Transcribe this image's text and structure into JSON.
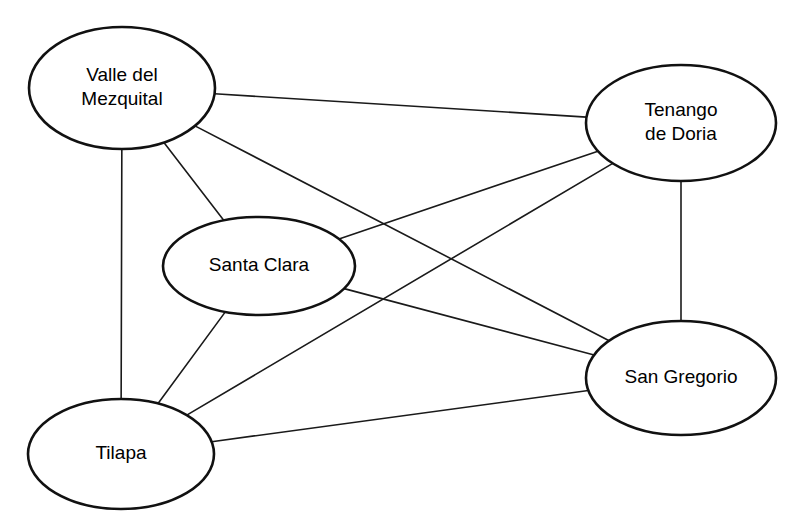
{
  "diagram": {
    "type": "node-link-network",
    "background_color": "#ffffff",
    "node_fill_color": "#ffffff",
    "node_stroke_color": "#111111",
    "edge_color": "#1a1a1a",
    "label_color": "#000000",
    "nodes": [
      {
        "id": "valle-del-mezquital",
        "label": "Valle del\nMezquital",
        "label_lines": [
          "Valle del",
          "Mezquital"
        ],
        "cx": 122,
        "cy": 88,
        "rx": 93,
        "ry": 61
      },
      {
        "id": "tenango-de-doria",
        "label": "Tenango\nde Doria",
        "label_lines": [
          "Tenango",
          "de Doria"
        ],
        "cx": 681,
        "cy": 123,
        "rx": 95,
        "ry": 58
      },
      {
        "id": "santa-clara",
        "label": "Santa Clara",
        "label_lines": [
          "Santa Clara"
        ],
        "cx": 259,
        "cy": 266,
        "rx": 96,
        "ry": 49
      },
      {
        "id": "san-gregorio",
        "label": "San Gregorio",
        "label_lines": [
          "San Gregorio"
        ],
        "cx": 681,
        "cy": 378,
        "rx": 95,
        "ry": 57
      },
      {
        "id": "tilapa",
        "label": "Tilapa",
        "label_lines": [
          "Tilapa"
        ],
        "cx": 121,
        "cy": 454,
        "rx": 93,
        "ry": 55
      }
    ],
    "edges": [
      {
        "id": "edge-valle-tenango",
        "source": "valle-del-mezquital",
        "target": "tenango-de-doria"
      },
      {
        "id": "edge-valle-santaclara",
        "source": "valle-del-mezquital",
        "target": "santa-clara"
      },
      {
        "id": "edge-valle-tilapa",
        "source": "valle-del-mezquital",
        "target": "tilapa"
      },
      {
        "id": "edge-valle-sangregorio",
        "source": "valle-del-mezquital",
        "target": "san-gregorio"
      },
      {
        "id": "edge-tenango-santaclara",
        "source": "tenango-de-doria",
        "target": "santa-clara"
      },
      {
        "id": "edge-tenango-tilapa",
        "source": "tenango-de-doria",
        "target": "tilapa"
      },
      {
        "id": "edge-tenango-sangregorio",
        "source": "tenango-de-doria",
        "target": "san-gregorio"
      },
      {
        "id": "edge-santaclara-tilapa",
        "source": "santa-clara",
        "target": "tilapa"
      },
      {
        "id": "edge-santaclara-sangregorio",
        "source": "santa-clara",
        "target": "san-gregorio"
      },
      {
        "id": "edge-tilapa-sangregorio",
        "source": "tilapa",
        "target": "san-gregorio"
      }
    ]
  }
}
